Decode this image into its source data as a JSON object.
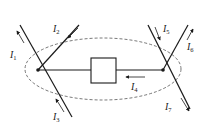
{
  "diagram": {
    "type": "circuit-node-current-diagram",
    "colors": {
      "line": "#1a1a1a",
      "dashed": "#555555",
      "background": "#ffffff"
    },
    "labels": {
      "I1": {
        "main": "I",
        "sub": "1"
      },
      "I2": {
        "main": "I",
        "sub": "2"
      },
      "I3": {
        "main": "I",
        "sub": "3"
      },
      "I4": {
        "main": "I",
        "sub": "4"
      },
      "I5": {
        "main": "I",
        "sub": "5"
      },
      "I6": {
        "main": "I",
        "sub": "6"
      },
      "I7": {
        "main": "I",
        "sub": "7"
      }
    },
    "nodes": [
      "left-node",
      "right-node"
    ],
    "elements": [
      "box-element"
    ],
    "closed_surface": "dashed-ellipse"
  }
}
